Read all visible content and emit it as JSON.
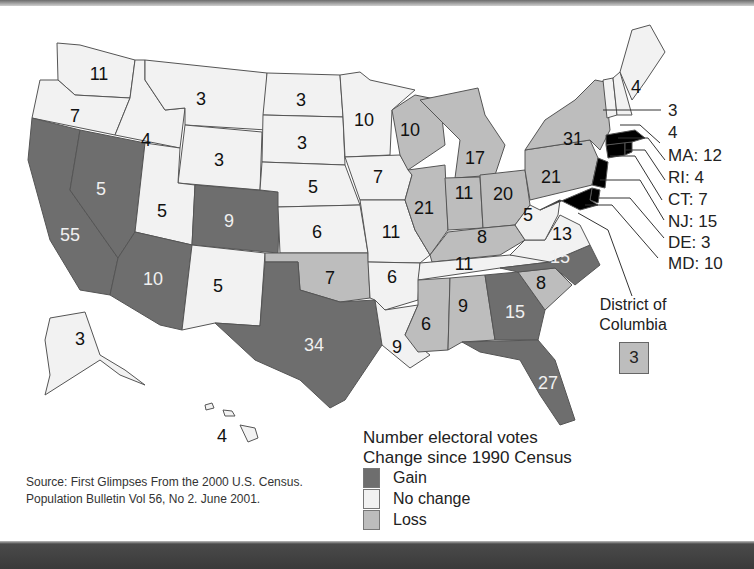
{
  "colors": {
    "gain": "#6e6e6e",
    "no_change": "#f2f2f2",
    "loss": "#bdbdbd",
    "border": "#555555"
  },
  "legend": {
    "title_line1": "Number electoral votes",
    "title_line2": "Change since 1990 Census",
    "items": [
      {
        "label": "Gain",
        "category": "gain"
      },
      {
        "label": "No change",
        "category": "no_change"
      },
      {
        "label": "Loss",
        "category": "loss"
      }
    ]
  },
  "source": "Source: First Glimpses From the 2000 U.S. Census. Population Bulletin Vol 56, No 2. June 2001.",
  "dc": {
    "label_line1": "District of",
    "label_line2": "Columbia",
    "votes": "3",
    "category": "loss"
  },
  "states": {
    "WA": {
      "votes": "11",
      "category": "no_change"
    },
    "OR": {
      "votes": "7",
      "category": "no_change"
    },
    "CA": {
      "votes": "55",
      "category": "gain"
    },
    "NV": {
      "votes": "5",
      "category": "gain"
    },
    "ID": {
      "votes": "4",
      "category": "no_change"
    },
    "MT": {
      "votes": "3",
      "category": "no_change"
    },
    "WY": {
      "votes": "3",
      "category": "no_change"
    },
    "UT": {
      "votes": "5",
      "category": "no_change"
    },
    "CO": {
      "votes": "9",
      "category": "gain"
    },
    "AZ": {
      "votes": "10",
      "category": "gain"
    },
    "NM": {
      "votes": "5",
      "category": "no_change"
    },
    "ND": {
      "votes": "3",
      "category": "no_change"
    },
    "SD": {
      "votes": "3",
      "category": "no_change"
    },
    "NE": {
      "votes": "5",
      "category": "no_change"
    },
    "KS": {
      "votes": "6",
      "category": "no_change"
    },
    "OK": {
      "votes": "7",
      "category": "loss"
    },
    "TX": {
      "votes": "34",
      "category": "gain"
    },
    "MN": {
      "votes": "10",
      "category": "no_change"
    },
    "IA": {
      "votes": "7",
      "category": "no_change"
    },
    "MO": {
      "votes": "11",
      "category": "no_change"
    },
    "AR": {
      "votes": "6",
      "category": "no_change"
    },
    "LA": {
      "votes": "9",
      "category": "no_change"
    },
    "WI": {
      "votes": "10",
      "category": "loss"
    },
    "IL": {
      "votes": "21",
      "category": "loss"
    },
    "MI": {
      "votes": "17",
      "category": "loss"
    },
    "IN": {
      "votes": "11",
      "category": "loss"
    },
    "OH": {
      "votes": "20",
      "category": "loss"
    },
    "KY": {
      "votes": "8",
      "category": "loss"
    },
    "TN": {
      "votes": "11",
      "category": "no_change"
    },
    "MS": {
      "votes": "6",
      "category": "loss"
    },
    "AL": {
      "votes": "9",
      "category": "loss"
    },
    "GA": {
      "votes": "15",
      "category": "gain"
    },
    "FL": {
      "votes": "27",
      "category": "gain"
    },
    "SC": {
      "votes": "8",
      "category": "loss"
    },
    "NC": {
      "votes": "15",
      "category": "gain"
    },
    "VA": {
      "votes": "13",
      "category": "no_change"
    },
    "WV": {
      "votes": "5",
      "category": "no_change"
    },
    "PA": {
      "votes": "21",
      "category": "loss"
    },
    "NY": {
      "votes": "31",
      "category": "loss"
    },
    "ME": {
      "votes": "4",
      "category": "no_change"
    },
    "VT": {
      "votes": "3",
      "category": "no_change"
    },
    "NH": {
      "votes": "4",
      "category": "no_change"
    },
    "AK": {
      "votes": "3",
      "category": "no_change"
    },
    "HI": {
      "votes": "4",
      "category": "no_change"
    }
  },
  "callouts": {
    "VT": "3",
    "NH": "4",
    "MA": "MA: 12",
    "RI": "RI: 4",
    "CT": "CT: 7",
    "NJ": "NJ: 15",
    "DE": "DE: 3",
    "MD": "MD: 10"
  }
}
